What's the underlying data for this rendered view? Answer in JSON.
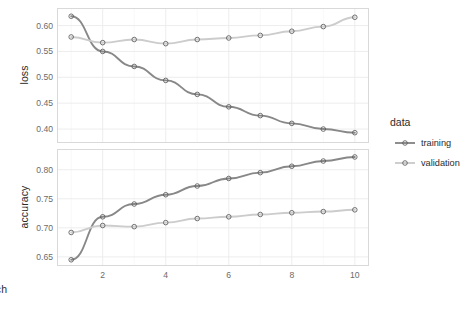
{
  "chart_data": {
    "type": "line",
    "title": "",
    "xlabel": "epoch",
    "x": [
      1,
      2,
      3,
      4,
      5,
      6,
      7,
      8,
      9,
      10
    ],
    "xlim": [
      0.55,
      10.45
    ],
    "xticks": [
      2,
      4,
      6,
      8,
      10
    ],
    "xticklabels": [
      "2",
      "4",
      "6",
      "8",
      "10"
    ],
    "grid": true,
    "legend": {
      "title": "data",
      "position": "right",
      "entries": [
        {
          "name": "training",
          "color": "#888888"
        },
        {
          "name": "validation",
          "color": "#cccccc"
        }
      ]
    },
    "facets": [
      {
        "id": "loss",
        "ylabel": "loss",
        "ylim": [
          0.375,
          0.632
        ],
        "yticks": [
          0.4,
          0.45,
          0.5,
          0.55,
          0.6
        ],
        "yticklabels": [
          "0.40",
          "0.45",
          "0.50",
          "0.55",
          "0.60"
        ],
        "series": [
          {
            "name": "training",
            "color": "#888888",
            "values": [
              0.618,
              0.55,
              0.521,
              0.494,
              0.467,
              0.443,
              0.426,
              0.411,
              0.4,
              0.393
            ]
          },
          {
            "name": "validation",
            "color": "#cccccc",
            "values": [
              0.578,
              0.567,
              0.573,
              0.565,
              0.573,
              0.576,
              0.581,
              0.589,
              0.598,
              0.616
            ]
          }
        ]
      },
      {
        "id": "accuracy",
        "ylabel": "accuracy",
        "ylim": [
          0.636,
          0.834
        ],
        "yticks": [
          0.65,
          0.7,
          0.75,
          0.8
        ],
        "yticklabels": [
          "0.65",
          "0.70",
          "0.75",
          "0.80"
        ],
        "series": [
          {
            "name": "training",
            "color": "#888888",
            "values": [
              0.645,
              0.719,
              0.741,
              0.757,
              0.772,
              0.785,
              0.795,
              0.806,
              0.815,
              0.822
            ]
          },
          {
            "name": "validation",
            "color": "#cccccc",
            "values": [
              0.692,
              0.704,
              0.702,
              0.709,
              0.716,
              0.719,
              0.723,
              0.726,
              0.728,
              0.731
            ]
          }
        ]
      }
    ]
  }
}
